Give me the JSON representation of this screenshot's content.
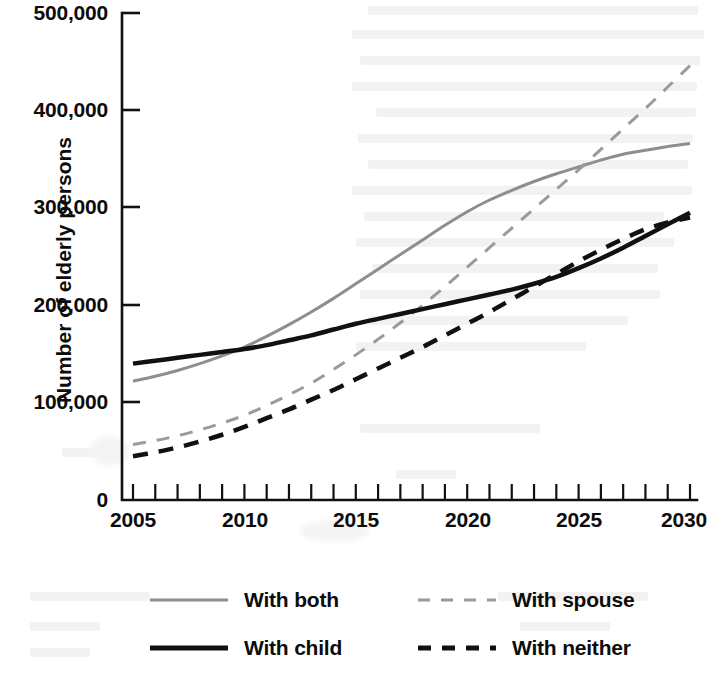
{
  "chart_data": {
    "type": "line",
    "title": "",
    "subtitle": "",
    "xlabel": "",
    "ylabel": "Number of elderly persons",
    "xlim": [
      2005,
      2030
    ],
    "xticks_major": [
      2005,
      2010,
      2015,
      2020,
      2025,
      2030
    ],
    "xtick_labels": [
      "2005",
      "2010",
      "2015",
      "2020",
      "2025",
      "2030"
    ],
    "xtick_minor_step": 1,
    "ylim": [
      0,
      500000
    ],
    "yticks": [
      0,
      100000,
      200000,
      300000,
      400000,
      500000
    ],
    "ytick_labels": [
      "0",
      "100,000",
      "200,000",
      "300,000",
      "400,000",
      "500,000"
    ],
    "grid": false,
    "legend_position": "bottom",
    "x": [
      2005,
      2006,
      2007,
      2008,
      2009,
      2010,
      2011,
      2012,
      2013,
      2014,
      2015,
      2016,
      2017,
      2018,
      2019,
      2020,
      2021,
      2022,
      2023,
      2024,
      2025,
      2026,
      2027,
      2028,
      2029,
      2030
    ],
    "series": [
      {
        "name": "With both",
        "style": "solid",
        "color": "#8e8e8e",
        "width": 3,
        "values": [
          122000,
          127000,
          133000,
          140000,
          148000,
          157000,
          168000,
          180000,
          193000,
          207000,
          222000,
          237000,
          252000,
          267000,
          282000,
          296000,
          308000,
          318000,
          327000,
          335000,
          342000,
          349000,
          355000,
          359000,
          363000,
          366000
        ]
      },
      {
        "name": "With spouse",
        "style": "dashed",
        "color": "#9a9a9a",
        "width": 3,
        "values": [
          57000,
          61000,
          66000,
          72000,
          79000,
          87000,
          97000,
          108000,
          120000,
          134000,
          149000,
          165000,
          182000,
          200000,
          219000,
          239000,
          259000,
          279000,
          299000,
          319000,
          339000,
          360000,
          381000,
          402000,
          424000,
          446000
        ]
      },
      {
        "name": "With child",
        "style": "solid",
        "color": "#111111",
        "width": 4.5,
        "values": [
          140000,
          143000,
          146000,
          149000,
          152000,
          155000,
          159000,
          164000,
          169000,
          175000,
          181000,
          186000,
          191000,
          196000,
          201000,
          206000,
          211000,
          216000,
          222000,
          229000,
          238000,
          248000,
          259000,
          271000,
          283000,
          295000
        ]
      },
      {
        "name": "With neither",
        "style": "dashed",
        "color": "#111111",
        "width": 4.5,
        "values": [
          45000,
          49000,
          54000,
          60000,
          67000,
          75000,
          84000,
          93000,
          103000,
          113000,
          124000,
          135000,
          146000,
          157000,
          169000,
          181000,
          193000,
          206000,
          219000,
          232000,
          245000,
          257000,
          268000,
          278000,
          285000,
          290000
        ]
      }
    ]
  },
  "axis": {
    "y_title": "Number of elderly persons",
    "y_labels": [
      "500,000",
      "400,000",
      "300,000",
      "200,000",
      "100,000",
      "0"
    ],
    "x_labels": [
      "2005",
      "2010",
      "2015",
      "2020",
      "2025",
      "2030"
    ]
  },
  "legend": {
    "rows": [
      {
        "left": {
          "label": "With both",
          "style": "solid",
          "color": "#8e8e8e",
          "thickness": 3
        },
        "right": {
          "label": "With spouse",
          "style": "dashed",
          "color": "#9a9a9a",
          "thickness": 3
        }
      },
      {
        "left": {
          "label": "With child",
          "style": "solid",
          "color": "#111111",
          "thickness": 5
        },
        "right": {
          "label": "With neither",
          "style": "dashed",
          "color": "#111111",
          "thickness": 5
        }
      }
    ]
  },
  "colors": {
    "axis": "#111111",
    "gray_series": "#8e8e8e",
    "black_series": "#111111",
    "background": "#ffffff"
  }
}
